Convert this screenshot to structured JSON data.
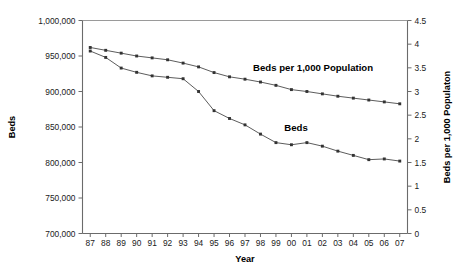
{
  "chart_data": {
    "type": "line",
    "title": "",
    "xlabel": "Year",
    "ylabel": "Beds",
    "y2label": "Beds per 1,000 Populaton",
    "grid": false,
    "legend_position": "inline-annotation",
    "x": [
      "87",
      "88",
      "89",
      "90",
      "91",
      "92",
      "93",
      "94",
      "95",
      "96",
      "97",
      "98",
      "99",
      "00",
      "01",
      "02",
      "03",
      "04",
      "05",
      "06",
      "07"
    ],
    "categories": [
      "87",
      "88",
      "89",
      "90",
      "91",
      "92",
      "93",
      "94",
      "95",
      "96",
      "97",
      "98",
      "99",
      "00",
      "01",
      "02",
      "03",
      "04",
      "05",
      "06",
      "07"
    ],
    "ylim": [
      700000,
      1000000
    ],
    "ytick_labels": [
      "700,000",
      "750,000",
      "800,000",
      "850,000",
      "900,000",
      "950,000",
      "1,000,000"
    ],
    "ytick_values": [
      700000,
      750000,
      800000,
      850000,
      900000,
      950000,
      1000000
    ],
    "y2lim": [
      0,
      4.5
    ],
    "y2tick_labels": [
      "0",
      "0.5",
      "1",
      "1.5",
      "2",
      "2.5",
      "3",
      "3.5",
      "4",
      "4.5"
    ],
    "y2tick_values": [
      0,
      0.5,
      1,
      1.5,
      2,
      2.5,
      3,
      3.5,
      4,
      4.5
    ],
    "series": [
      {
        "name": "Beds",
        "axis": "left",
        "label_text": "Beds",
        "values": [
          957000,
          948000,
          933000,
          927000,
          922000,
          920000,
          918000,
          900000,
          873000,
          862000,
          853000,
          840000,
          828000,
          825000,
          828000,
          823000,
          816000,
          810000,
          804000,
          805000,
          802000
        ]
      },
      {
        "name": "Beds per 1,000 Population",
        "axis": "right",
        "label_text": "Beds per 1,000 Population",
        "values": [
          3.93,
          3.87,
          3.81,
          3.75,
          3.71,
          3.67,
          3.6,
          3.52,
          3.4,
          3.31,
          3.26,
          3.2,
          3.13,
          3.04,
          3.0,
          2.95,
          2.9,
          2.86,
          2.82,
          2.78,
          2.74
        ]
      }
    ],
    "annotations": [
      {
        "name": "beds-per-1000-label",
        "text": "Beds per 1,000 Population",
        "x": 14.4,
        "y": 3.44
      },
      {
        "name": "beds-label",
        "text": "Beds",
        "x": 13.3,
        "y": 845000
      }
    ]
  }
}
